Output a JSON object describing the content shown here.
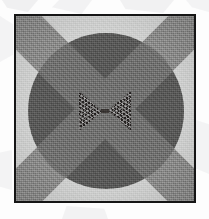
{
  "figure": {
    "caption": "",
    "outer_background_color": "#fdfdfd",
    "frame": {
      "border_color": "#151515",
      "border_width_px": 2,
      "left_px": 14,
      "top_px": 14,
      "width_px": 182,
      "height_px": 189
    },
    "plate_background_color": "#cfd0cf",
    "elements": [
      {
        "name": "background-field",
        "shape": "rectangle",
        "color": "#cfd0cf",
        "texture": "fine speckled grain",
        "label": "light speckled ground"
      },
      {
        "name": "dark-circle",
        "shape": "circle",
        "color": "#585857",
        "center_x_px": 90,
        "center_y_px": 95,
        "radius_px": 78,
        "label": "large dark grey disc"
      },
      {
        "name": "diagonal-band-down-right",
        "shape": "band",
        "color": "#8b8b8a",
        "rotation_deg": 45,
        "thickness_px": 42,
        "label": "medium grey diagonal stripe"
      },
      {
        "name": "diagonal-band-down-left",
        "shape": "band",
        "color": "#8b8b8a",
        "rotation_deg": -45,
        "thickness_px": 42,
        "label": "medium grey diagonal stripe"
      },
      {
        "name": "bowtie-left-triangle",
        "shape": "triangle",
        "color": "#23201f",
        "texture": "high-contrast noise speckle",
        "label": "left triangle of bow-tie"
      },
      {
        "name": "bowtie-right-triangle",
        "shape": "triangle",
        "color": "#23201f",
        "texture": "high-contrast noise speckle",
        "label": "right triangle of bow-tie"
      }
    ],
    "palette": {
      "paper": "#fdfdfd",
      "frame": "#151515",
      "ground": "#cfd0cf",
      "band": "#8b8b8a",
      "band_over_circle": "#6f6f6e",
      "circle": "#585857",
      "bowtie": "#23201f"
    }
  }
}
